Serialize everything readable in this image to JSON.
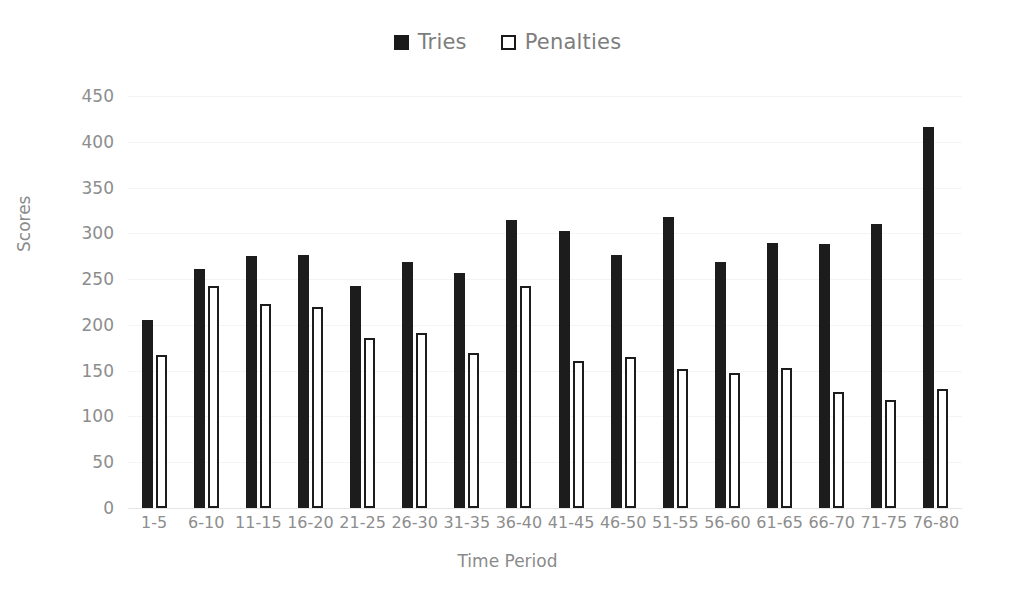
{
  "chart_data": {
    "type": "bar",
    "title": "",
    "xlabel": "Time Period",
    "ylabel": "Scores",
    "ylim": [
      0,
      450
    ],
    "yticks": [
      0,
      50,
      100,
      150,
      200,
      250,
      300,
      350,
      400,
      450
    ],
    "grid": true,
    "legend_position": "top-center",
    "categories": [
      "1-5",
      "6-10",
      "11-15",
      "16-20",
      "21-25",
      "26-30",
      "31-35",
      "36-40",
      "41-45",
      "46-50",
      "51-55",
      "56-60",
      "61-65",
      "66-70",
      "71-75",
      "76-80"
    ],
    "series": [
      {
        "name": "Tries",
        "color": "#1c1c1c",
        "style": "filled",
        "values": [
          205,
          261,
          275,
          276,
          243,
          269,
          257,
          315,
          303,
          276,
          318,
          269,
          289,
          288,
          310,
          416
        ]
      },
      {
        "name": "Penalties",
        "color": "#ffffff",
        "edge_color": "#1c1c1c",
        "style": "hollow",
        "values": [
          167,
          242,
          223,
          220,
          186,
          191,
          169,
          243,
          161,
          165,
          152,
          147,
          153,
          127,
          118,
          130
        ]
      }
    ]
  },
  "legend": {
    "entries": [
      {
        "label": "Tries",
        "swatch": "filled-square-icon"
      },
      {
        "label": "Penalties",
        "swatch": "hollow-square-icon"
      }
    ]
  },
  "axes": {
    "y_title": "Scores",
    "x_title": "Time Period",
    "y_tick_labels": [
      "450",
      "400",
      "350",
      "300",
      "250",
      "200",
      "150",
      "100",
      "50",
      "0"
    ]
  },
  "colors": {
    "tries_fill": "#1c1c1c",
    "penalties_fill": "#ffffff",
    "penalties_stroke": "#1c1c1c",
    "text": "#8a8a8a",
    "gridline": "#f4f4f4",
    "background": "#ffffff"
  }
}
